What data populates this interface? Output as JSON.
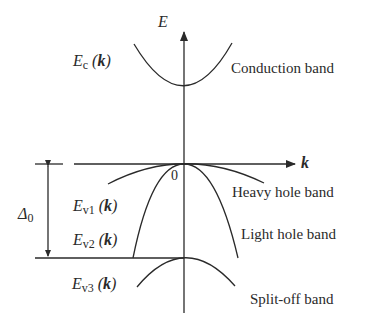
{
  "diagram": {
    "axes": {
      "vertical_label": "E",
      "horizontal_label": "k",
      "origin_label": "0"
    },
    "bands": [
      {
        "symbol": "E",
        "subscript": "c",
        "arg": "k",
        "name": "Conduction band"
      },
      {
        "symbol": "E",
        "subscript": "v1",
        "arg": "k",
        "name": "Heavy hole band"
      },
      {
        "symbol": "E",
        "subscript": "v2",
        "arg": "k",
        "name": "Light hole band"
      },
      {
        "symbol": "E",
        "subscript": "v3",
        "arg": "k",
        "name": "Split-off band"
      }
    ],
    "split_off_energy": {
      "symbol": "Δ",
      "subscript": "0"
    },
    "colors": {
      "line": "#2a2a2a",
      "background": "#ffffff"
    }
  }
}
